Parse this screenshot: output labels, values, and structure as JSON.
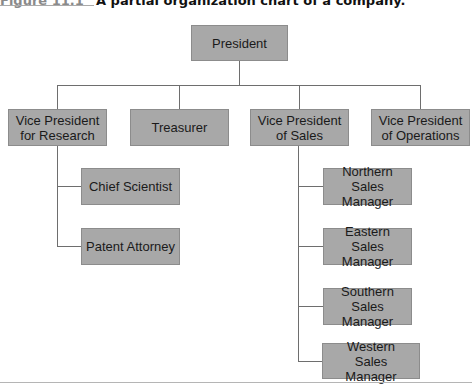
{
  "caption": {
    "figure_label": "Figure 11.1",
    "title": "A partial organization chart of a company."
  },
  "chart": {
    "root": "President",
    "level1": [
      {
        "label": "Vice President for Research"
      },
      {
        "label": "Treasurer"
      },
      {
        "label": "Vice President of Sales"
      },
      {
        "label": "Vice President of Operations"
      }
    ],
    "research_reports": [
      {
        "label": "Chief Scientist"
      },
      {
        "label": "Patent Attorney"
      }
    ],
    "sales_reports": [
      {
        "label": "Northern Sales Manager"
      },
      {
        "label": "Eastern Sales Manager"
      },
      {
        "label": "Southern Sales Manager"
      },
      {
        "label": "Western Sales Manager"
      }
    ]
  },
  "colors": {
    "box_fill": "#a8a8a8",
    "box_border": "#8c8c8c",
    "connector": "#6e6e6e",
    "figure_label": "#8a8a8a"
  }
}
